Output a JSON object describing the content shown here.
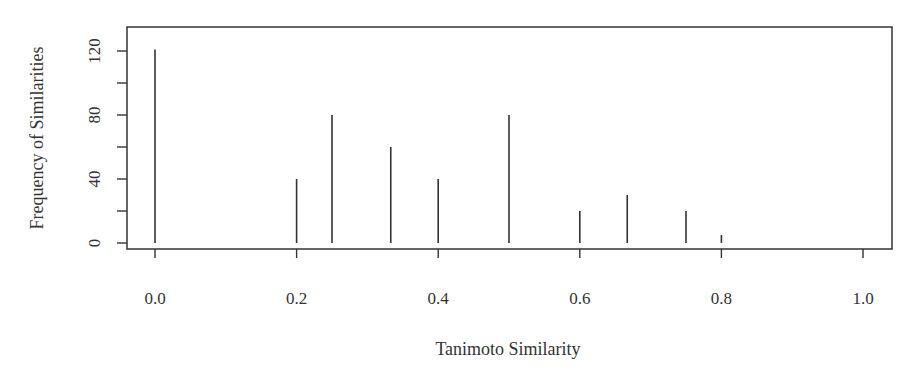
{
  "chart_data": {
    "type": "bar",
    "style": "histogram-spikes",
    "title": "",
    "xlabel": "Tanimoto Similarity",
    "ylabel": "Frequency of Similarities",
    "x": [
      0.0,
      0.2,
      0.25,
      0.333,
      0.4,
      0.5,
      0.6,
      0.667,
      0.75,
      0.8
    ],
    "values": [
      121,
      40,
      80,
      60,
      40,
      80,
      20,
      30,
      20,
      5
    ],
    "xlim": [
      -0.04,
      1.04
    ],
    "ylim": [
      -5,
      136
    ],
    "xticks": [
      0.0,
      0.2,
      0.4,
      0.6,
      0.8,
      1.0
    ],
    "xtick_labels": [
      "0.0",
      "0.2",
      "0.4",
      "0.6",
      "0.8",
      "1.0"
    ],
    "yticks": [
      0,
      20,
      40,
      60,
      80,
      100,
      120
    ],
    "ytick_labels": [
      "0",
      "",
      "40",
      "",
      "80",
      "",
      "120"
    ],
    "grid": false,
    "legend": null,
    "line_color": "#333333"
  }
}
